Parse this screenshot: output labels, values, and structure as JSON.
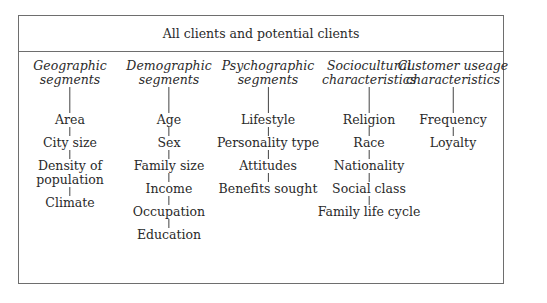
{
  "title": "All clients and potential clients",
  "columns": [
    {
      "title_line1": "Geographic",
      "title_line2": "segments",
      "items": [
        "Area",
        "City size",
        "Density of\npopulation",
        "Climate"
      ]
    },
    {
      "title_line1": "Demographic",
      "title_line2": "segments",
      "items": [
        "Age",
        "Sex",
        "Family size",
        "Income",
        "Occupation",
        "Education"
      ]
    },
    {
      "title_line1": "Psychographic",
      "title_line2": "segments",
      "items": [
        "Lifestyle",
        "Personality type",
        "Attitudes",
        "Benefits sought"
      ]
    },
    {
      "title_line1": "Sociocultural",
      "title_line2": "characteristics",
      "items": [
        "Religion",
        "Race",
        "Nationality",
        "Social class",
        "Family life cycle"
      ]
    },
    {
      "title_line1": "Customer useage",
      "title_line2": "characteristics",
      "items": [
        "Frequency",
        "Loyalty"
      ]
    }
  ]
}
